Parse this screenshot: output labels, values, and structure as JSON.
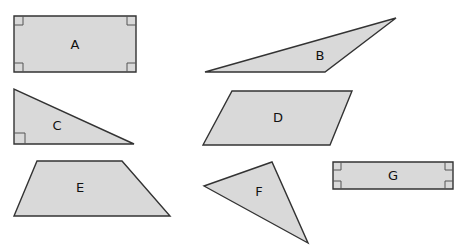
{
  "figure": {
    "background": "#ffffff",
    "fill_color": "#d9d9d9",
    "stroke_color": "#333333",
    "shapes": [
      {
        "id": "A",
        "label": "A",
        "type": "rectangle",
        "points": "14,16 136,16 136,72 14,72",
        "label_pos": [
          75,
          45
        ],
        "right_angle_markers": 4
      },
      {
        "id": "B",
        "label": "B",
        "type": "obtuse-triangle",
        "points": "205,72 396,18 325,72",
        "label_pos": [
          320,
          56
        ]
      },
      {
        "id": "C",
        "label": "C",
        "type": "right-triangle",
        "points": "14,89 14,144 134,144",
        "label_pos": [
          57,
          126
        ],
        "right_angle_markers": 1
      },
      {
        "id": "D",
        "label": "D",
        "type": "parallelogram",
        "points": "232,91 352,91 330,145 203,145",
        "label_pos": [
          278,
          118
        ]
      },
      {
        "id": "E",
        "label": "E",
        "type": "trapezoid",
        "points": "37,161 122,161 170,216 14,216",
        "label_pos": [
          80,
          188
        ]
      },
      {
        "id": "F",
        "label": "F",
        "type": "triangle",
        "points": "204,186 272,162 308,243",
        "label_pos": [
          259,
          192
        ]
      },
      {
        "id": "G",
        "label": "G",
        "type": "rectangle",
        "points": "333,162 453,162 453,189 333,189",
        "label_pos": [
          393,
          176
        ],
        "right_angle_markers": 4
      }
    ]
  }
}
